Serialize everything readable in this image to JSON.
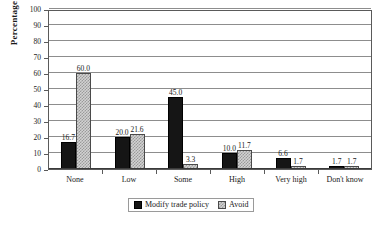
{
  "chart_data": {
    "type": "bar",
    "title": "",
    "subtitle": "",
    "xlabel": "",
    "ylabel": "Percentage",
    "ylim": [
      0,
      100
    ],
    "yticks": [
      0,
      10,
      20,
      30,
      40,
      50,
      60,
      70,
      80,
      90,
      100
    ],
    "grid": true,
    "legend_position": "bottom",
    "categories": [
      "None",
      "Low",
      "Some",
      "High",
      "Very high",
      "Don't know"
    ],
    "series": [
      {
        "name": "Modify trade policy",
        "color": "#151515",
        "values": [
          16.7,
          20.0,
          45.0,
          10.0,
          6.6,
          1.7
        ],
        "labels": [
          "16.7",
          "20.0",
          "45.0",
          "10.0",
          "6.6",
          "1.7"
        ]
      },
      {
        "name": "Avoid",
        "color": "#d2d2d2",
        "values": [
          60.0,
          21.6,
          3.3,
          11.7,
          1.7,
          1.7
        ],
        "labels": [
          "60.0",
          "21.6",
          "3.3",
          "11.7",
          "1.7",
          "1.7"
        ]
      }
    ]
  },
  "axis": {
    "y_title": "Percentage",
    "y_tick_labels": [
      "100",
      "90",
      "80",
      "70",
      "60",
      "50",
      "40",
      "30",
      "20",
      "10",
      "0"
    ],
    "x_tick_labels": [
      "None",
      "Low",
      "Some",
      "High",
      "Very high",
      "Don't know"
    ]
  },
  "legend": {
    "items": [
      {
        "label": "Modify trade policy",
        "swatch": "black-square-icon"
      },
      {
        "label": "Avoid",
        "swatch": "stippled-square-icon"
      }
    ]
  }
}
